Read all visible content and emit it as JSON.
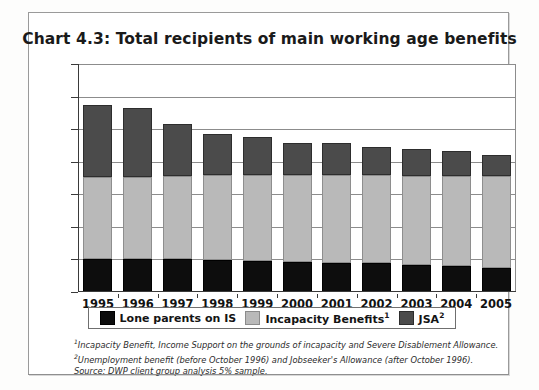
{
  "chart_data": {
    "type": "bar",
    "stacked": true,
    "title": "Chart 4.3: Total recipients of main working age benefits",
    "xlabel": "",
    "ylabel": "Recipients (thousands)",
    "ylim": [
      0,
      7000
    ],
    "ytick_labels": [
      "0",
      "1,000",
      "2,000",
      "3,000",
      "4,000",
      "5,000",
      "6,000",
      "7,000"
    ],
    "ytick_values": [
      0,
      1000,
      2000,
      3000,
      4000,
      5000,
      6000,
      7000
    ],
    "grid": true,
    "legend_position": "bottom",
    "categories": [
      "1995",
      "1996",
      "1997",
      "1998",
      "1999",
      "2000",
      "2001",
      "2002",
      "2003",
      "2004",
      "2005"
    ],
    "series": [
      {
        "name": "Lone parents on IS",
        "color": "#0d0d0d",
        "values": [
          1000,
          1000,
          1000,
          980,
          950,
          930,
          900,
          880,
          840,
          800,
          750
        ]
      },
      {
        "name": "Incapacity Benefits",
        "color": "#b9b9b9",
        "values": [
          2520,
          2540,
          2550,
          2600,
          2630,
          2650,
          2680,
          2700,
          2720,
          2770,
          2800
        ]
      },
      {
        "name": "JSA",
        "color": "#4b4b4b",
        "values": [
          2230,
          2100,
          1600,
          1280,
          1180,
          1010,
          1000,
          880,
          820,
          760,
          650
        ]
      }
    ],
    "totals": [
      5750,
      5640,
      5150,
      4860,
      4760,
      4590,
      4580,
      4460,
      4380,
      4330,
      4200
    ]
  },
  "legend": {
    "items": [
      {
        "label": "Lone parents on IS",
        "sup": "",
        "swatch": "lone"
      },
      {
        "label": "Incapacity Benefits",
        "sup": "1",
        "swatch": "incap"
      },
      {
        "label": "JSA",
        "sup": "2",
        "swatch": "jsa"
      }
    ]
  },
  "footnotes": {
    "one_marker": "1",
    "one": "Incapacity Benefit, Income Support on the grounds of incapacity and Severe Disablement Allowance.",
    "two_marker": "2",
    "two": "Unemployment benefit (before October 1996) and Jobseeker's Allowance (after October 1996).",
    "source": "Source: DWP client group analysis 5% sample."
  }
}
